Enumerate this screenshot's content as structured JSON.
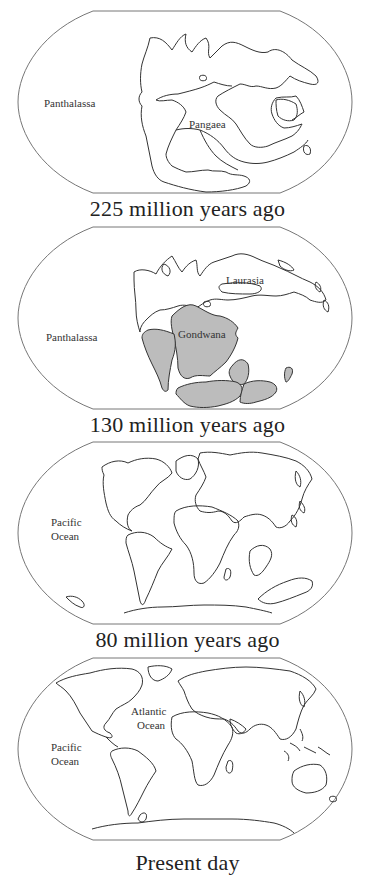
{
  "colors": {
    "frame": "#777777",
    "outline": "#333333",
    "gondwana_fill": "#bcbcbc",
    "background": "#ffffff"
  },
  "panels": [
    {
      "caption": "225 million years ago",
      "labels": {
        "ocean": "Panthalassa",
        "continent": "Pangaea"
      }
    },
    {
      "caption": "130 million years ago",
      "labels": {
        "ocean": "Panthalassa",
        "north": "Laurasia",
        "south": "Gondwana"
      }
    },
    {
      "caption": "80 million years ago",
      "labels": {
        "ocean_line1": "Pacific",
        "ocean_line2": "Ocean"
      }
    },
    {
      "caption": "Present day",
      "labels": {
        "pacific_line1": "Pacific",
        "pacific_line2": "Ocean",
        "atlantic_line1": "Atlantic",
        "atlantic_line2": "Ocean"
      }
    }
  ]
}
